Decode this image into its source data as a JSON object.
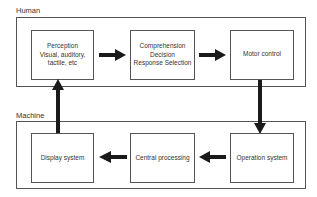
{
  "diagram": {
    "groups": {
      "human": {
        "label": "Human",
        "boxes": {
          "perception": {
            "lines": [
              "Perception",
              "Visual, auditory,",
              "tactile, etc"
            ]
          },
          "comprehension": {
            "lines": [
              "Comprehension",
              "Decision",
              "Response Selection"
            ]
          },
          "motor": {
            "lines": [
              "Motor control"
            ]
          }
        }
      },
      "machine": {
        "label": "Machine",
        "boxes": {
          "display": {
            "lines": [
              "Display system"
            ]
          },
          "central": {
            "lines": [
              "Central processing"
            ]
          },
          "operation": {
            "lines": [
              "Operation system"
            ]
          }
        }
      }
    },
    "edges": [
      {
        "from": "Perception",
        "to": "Comprehension"
      },
      {
        "from": "Comprehension",
        "to": "Motor control"
      },
      {
        "from": "Motor control",
        "to": "Operation system"
      },
      {
        "from": "Operation system",
        "to": "Central processing"
      },
      {
        "from": "Central processing",
        "to": "Display system"
      },
      {
        "from": "Display system",
        "to": "Perception"
      }
    ],
    "colors": {
      "line": "#555555",
      "arrow": "#1a1a1a",
      "background": "#ffffff"
    }
  }
}
